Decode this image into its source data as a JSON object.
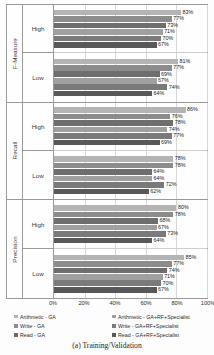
{
  "caption": "(a) Training/Validation",
  "axis": {
    "xticks": [
      "0%",
      "20%",
      "40%",
      "60%",
      "80%",
      "100%"
    ],
    "xmin": 0,
    "xmax": 100
  },
  "series_colors": [
    "#b4b4b4",
    "#8c8c8c",
    "#6e6e6e",
    "#a0a0a0",
    "#7a7a7a",
    "#585858"
  ],
  "legend": {
    "left": [
      {
        "label": "Arithmetic - GA",
        "color": "#b4b4b4"
      },
      {
        "label": "Write - GA",
        "color": "#8c8c8c"
      },
      {
        "label": "Read - GA",
        "color": "#6e6e6e"
      }
    ],
    "right": [
      {
        "label": "Arithmetic - GA+RF+Specialist",
        "color": "#a0a0a0"
      },
      {
        "label": "Write - GA+RF+Specialist",
        "color": "#7a7a7a"
      },
      {
        "label": "Read - GA+RF+Specialist",
        "color": "#585858"
      }
    ]
  },
  "chart_data": {
    "type": "bar",
    "orientation": "horizontal",
    "title": "",
    "xlabel": "",
    "ylabel": "",
    "xlim": [
      0,
      100
    ],
    "grid": true,
    "legend_position": "bottom",
    "categories": [
      "F-Measure / High",
      "F-Measure / Low",
      "Recall / High",
      "Recall / Low",
      "Precision / High",
      "Precision / Low"
    ],
    "series": [
      {
        "name": "Arithmetic - GA",
        "values": [
          83,
          81,
          86,
          78,
          80,
          85
        ]
      },
      {
        "name": "Write - GA",
        "values": [
          77,
          77,
          76,
          78,
          78,
          77
        ]
      },
      {
        "name": "Read - GA",
        "values": [
          73,
          69,
          78,
          64,
          68,
          74
        ]
      },
      {
        "name": "Arithmetic - GA+RF+Specialist",
        "values": [
          71,
          67,
          74,
          64,
          67,
          71
        ]
      },
      {
        "name": "Write - GA+RF+Specialist",
        "values": [
          70,
          74,
          77,
          72,
          73,
          70
        ]
      },
      {
        "name": "Read - GA+RF+Specialist",
        "values": [
          67,
          64,
          69,
          62,
          64,
          67
        ]
      }
    ],
    "groups": [
      {
        "metric": "F-Measure",
        "levels": [
          {
            "level": "High",
            "values": [
              83,
              77,
              73,
              71,
              70,
              67
            ],
            "labels": [
              "83%",
              "77%",
              "73%",
              "71%",
              "70%",
              "67%"
            ]
          },
          {
            "level": "Low",
            "values": [
              81,
              77,
              69,
              67,
              74,
              64
            ],
            "labels": [
              "81%",
              "77%",
              "69%",
              "67%",
              "74%",
              "64%"
            ]
          }
        ]
      },
      {
        "metric": "Recall",
        "levels": [
          {
            "level": "High",
            "values": [
              86,
              76,
              78,
              74,
              77,
              69
            ],
            "labels": [
              "86%",
              "76%",
              "78%",
              "74%",
              "77%",
              "69%"
            ]
          },
          {
            "level": "Low",
            "values": [
              78,
              78,
              64,
              64,
              72,
              62
            ],
            "labels": [
              "78%",
              "78%",
              "64%",
              "64%",
              "72%",
              "62%"
            ]
          }
        ]
      },
      {
        "metric": "Precision",
        "levels": [
          {
            "level": "High",
            "values": [
              80,
              78,
              68,
              67,
              73,
              64
            ],
            "labels": [
              "80%",
              "78%",
              "68%",
              "67%",
              "73%",
              "64%"
            ]
          },
          {
            "level": "Low",
            "values": [
              85,
              77,
              74,
              71,
              70,
              67
            ],
            "labels": [
              "85%",
              "77%",
              "74%",
              "71%",
              "70%",
              "67%"
            ]
          }
        ]
      }
    ]
  }
}
